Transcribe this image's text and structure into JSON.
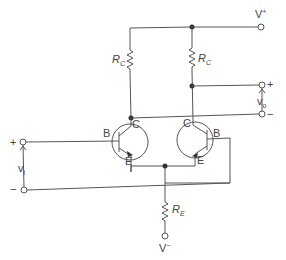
{
  "diagram": {
    "type": "circuit-schematic",
    "supplies": {
      "positive": "V",
      "positive_sup": "+",
      "negative": "V",
      "negative_sup": "−"
    },
    "resistors": {
      "collector_left": {
        "label": "R",
        "sub": "C"
      },
      "collector_right": {
        "label": "R",
        "sub": "C"
      },
      "emitter": {
        "label": "R",
        "sub": "E"
      }
    },
    "transistors": {
      "left": {
        "base": "B",
        "collector": "C",
        "emitter": "E"
      },
      "right": {
        "base": "B",
        "collector": "C",
        "emitter": "E"
      }
    },
    "input": {
      "label": "v",
      "sub": "i",
      "plus": "+",
      "minus": "−"
    },
    "output": {
      "label": "v",
      "sub": "o",
      "plus": "+",
      "minus": "−"
    }
  }
}
